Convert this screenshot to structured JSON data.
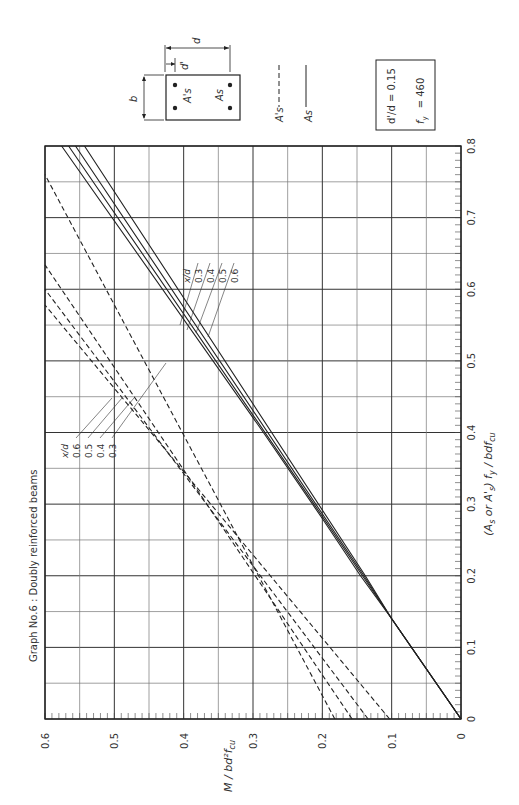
{
  "title": "Graph No.6 : Doubly reinforced beams",
  "parameters_box": {
    "line1": "d'/d = 0.15",
    "line2_label": "f",
    "line2_sub": "y",
    "line2_value": "= 460"
  },
  "legend": {
    "compression_label": "A's",
    "compression_style": "dashed",
    "tension_label": "As",
    "tension_style": "solid"
  },
  "section_diagram": {
    "width_label": "b",
    "depth_label": "d",
    "cover_label": "d'",
    "compression_steel_label": "A's",
    "tension_steel_label": "As"
  },
  "solid_labels": {
    "header": "x/d",
    "values": [
      "0.3",
      "0.4",
      "0.5",
      "0.6"
    ]
  },
  "dashed_labels": {
    "header": "x/d",
    "values": [
      "0.6",
      "0.5",
      "0.4",
      "0.3"
    ]
  },
  "chart_data": {
    "type": "line",
    "title": "Graph No.6 : Doubly reinforced beams",
    "xlabel": "(As or A's) fy / bd fcu",
    "ylabel": "M / bd² fcu",
    "xlim": [
      0,
      0.8
    ],
    "ylim": [
      0,
      0.6
    ],
    "xticks": [
      "0",
      "0.1",
      "0.2",
      "0.3",
      "0.4",
      "0.5",
      "0.6",
      "0.7",
      "0.8"
    ],
    "yticks": [
      "0",
      "0.1",
      "0.2",
      "0.3",
      "0.4",
      "0.5",
      "0.6"
    ],
    "grid": true,
    "orientation": "rotated 90° counter-clockwise on page",
    "annotations": [
      "d'/d = 0.15",
      "fy = 460"
    ],
    "series": [
      {
        "name": "As, x/d = 0.3",
        "style": "solid",
        "points": [
          [
            0,
            0
          ],
          [
            0.14,
            0.1
          ],
          [
            0.2,
            0.145
          ],
          [
            0.28,
            0.2
          ],
          [
            0.4,
            0.285
          ],
          [
            0.8,
            0.576
          ]
        ]
      },
      {
        "name": "As, x/d = 0.4",
        "style": "solid",
        "points": [
          [
            0,
            0
          ],
          [
            0.14,
            0.1
          ],
          [
            0.2,
            0.142
          ],
          [
            0.3,
            0.212
          ],
          [
            0.8,
            0.566
          ]
        ]
      },
      {
        "name": "As, x/d = 0.5",
        "style": "solid",
        "points": [
          [
            0,
            0
          ],
          [
            0.14,
            0.1
          ],
          [
            0.2,
            0.14
          ],
          [
            0.8,
            0.556
          ]
        ]
      },
      {
        "name": "As, x/d = 0.6",
        "style": "solid",
        "points": [
          [
            0,
            0
          ],
          [
            0.14,
            0.1
          ],
          [
            0.2,
            0.138
          ],
          [
            0.8,
            0.543
          ]
        ]
      },
      {
        "name": "A's, x/d = 0.6",
        "style": "dashed",
        "points": [
          [
            0,
            0.182
          ],
          [
            0.76,
            0.6
          ]
        ]
      },
      {
        "name": "A's, x/d = 0.5",
        "style": "dashed",
        "points": [
          [
            0,
            0.157
          ],
          [
            0.634,
            0.6
          ]
        ]
      },
      {
        "name": "A's, x/d = 0.4",
        "style": "dashed",
        "points": [
          [
            0,
            0.134
          ],
          [
            0.6,
            0.6
          ]
        ]
      },
      {
        "name": "A's, x/d = 0.3",
        "style": "dashed",
        "points": [
          [
            0,
            0.103
          ],
          [
            0.578,
            0.6
          ]
        ]
      }
    ]
  }
}
